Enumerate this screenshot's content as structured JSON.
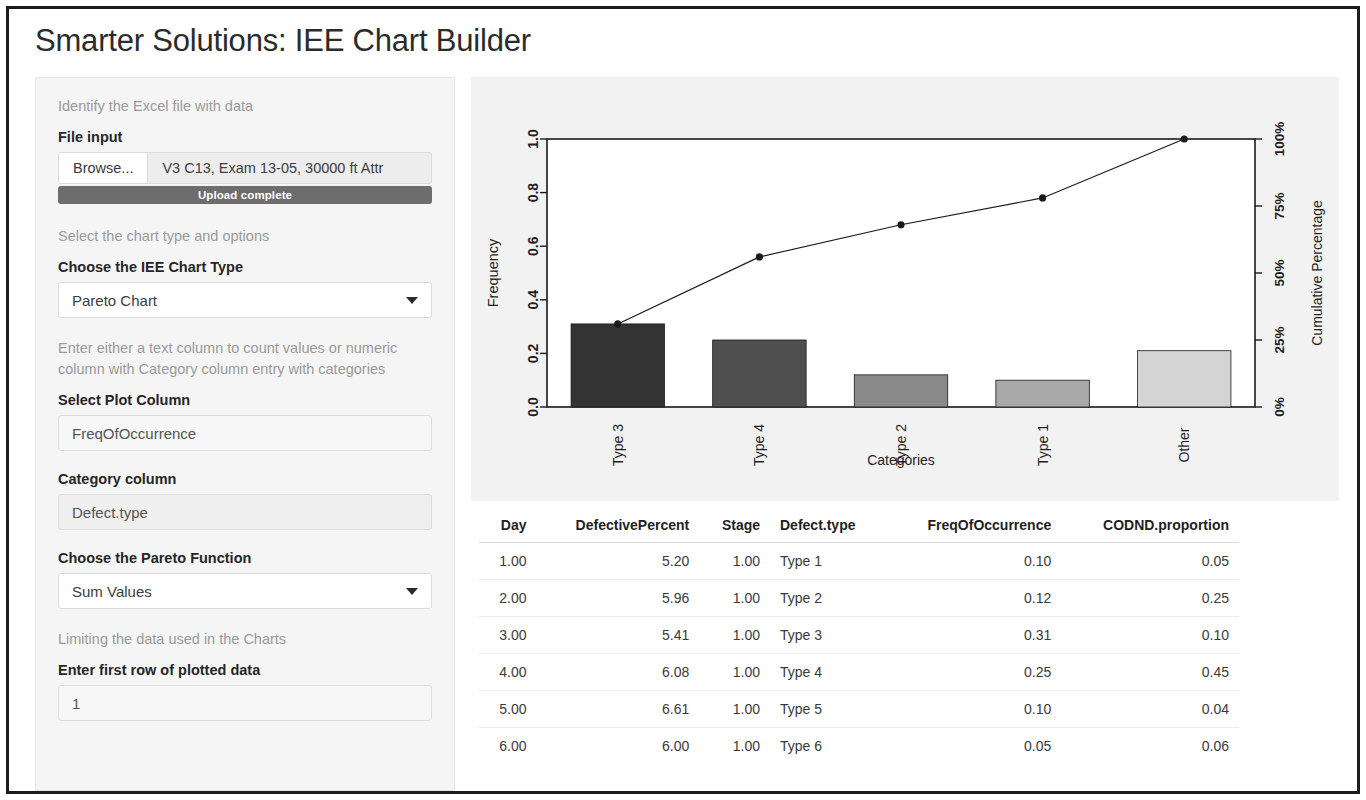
{
  "app": {
    "title": "Smarter Solutions: IEE Chart Builder"
  },
  "sidebar": {
    "file_section_note": "Identify the Excel file with data",
    "file_input_label": "File input",
    "browse_label": "Browse...",
    "file_name": "V3 C13, Exam 13-05, 30000 ft Attr",
    "upload_status": "Upload complete",
    "chart_section_note": "Select the chart type and options",
    "chart_type_label": "Choose the IEE Chart Type",
    "chart_type_value": "Pareto Chart",
    "plot_column_note": "Enter either a text column to count values or numeric column with Category column entry with categories",
    "plot_column_label": "Select Plot Column",
    "plot_column_value": "FreqOfOccurrence",
    "category_column_label": "Category column",
    "category_column_value": "Defect.type",
    "pareto_function_label": "Choose the Pareto Function",
    "pareto_function_value": "Sum Values",
    "limiting_note": "Limiting the data used in the Charts",
    "first_row_label": "Enter first row of plotted data",
    "first_row_value": "1"
  },
  "chart_data": {
    "type": "bar",
    "title": "IEE Pareto Chart of Frequency of Occurrence",
    "xlabel": "Categories",
    "ylabel": "Frequency",
    "y2label": "Cumulative Percentage",
    "categories": [
      "Type 3",
      "Type 4",
      "Type 2",
      "Type 1",
      "Other"
    ],
    "values": [
      0.31,
      0.25,
      0.12,
      0.1,
      0.21
    ],
    "ylim": [
      0.0,
      1.0
    ],
    "yticks": [
      "0.0",
      "0.2",
      "0.4",
      "0.6",
      "0.8",
      "1.0"
    ],
    "ytickvals": [
      0.0,
      0.2,
      0.4,
      0.6,
      0.8,
      1.0
    ],
    "y2ticks": [
      "0%",
      "25%",
      "50%",
      "75%",
      "100%"
    ],
    "y2tickvals": [
      0,
      25,
      50,
      75,
      100
    ],
    "grid": false,
    "legend": "none",
    "series": [
      {
        "name": "Frequency",
        "values": [
          0.31,
          0.25,
          0.12,
          0.1,
          0.21
        ]
      },
      {
        "name": "Cumulative Percentage",
        "values": [
          0.31,
          0.56,
          0.68,
          0.78,
          1.0
        ]
      }
    ],
    "bar_colors": [
      "#333333",
      "#4f4f4f",
      "#8a8a8a",
      "#a8a8a8",
      "#d4d4d4"
    ],
    "line_color": "#1a1a1a"
  },
  "table": {
    "columns": [
      "Day",
      "DefectivePercent",
      "Stage",
      "Defect.type",
      "FreqOfOccurrence",
      "CODND.proportion"
    ],
    "column_align": [
      "num",
      "num",
      "num",
      "txt",
      "num",
      "num"
    ],
    "rows": [
      [
        "1.00",
        "5.20",
        "1.00",
        "Type 1",
        "0.10",
        "0.05"
      ],
      [
        "2.00",
        "5.96",
        "1.00",
        "Type 2",
        "0.12",
        "0.25"
      ],
      [
        "3.00",
        "5.41",
        "1.00",
        "Type 3",
        "0.31",
        "0.10"
      ],
      [
        "4.00",
        "6.08",
        "1.00",
        "Type 4",
        "0.25",
        "0.45"
      ],
      [
        "5.00",
        "6.61",
        "1.00",
        "Type 5",
        "0.10",
        "0.04"
      ],
      [
        "6.00",
        "6.00",
        "1.00",
        "Type 6",
        "0.05",
        "0.06"
      ]
    ]
  }
}
